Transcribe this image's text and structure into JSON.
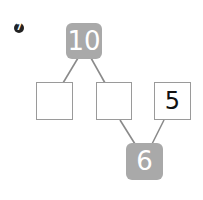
{
  "problem_number": "7",
  "top_node": {
    "value": "10"
  },
  "middle_row": [
    {
      "value": ""
    },
    {
      "value": ""
    },
    {
      "value": "5"
    }
  ],
  "bottom_node": {
    "value": "6"
  },
  "colors": {
    "filled_node": "#a9a9a9",
    "line": "#8a8a8a",
    "box_border": "#9a9a9a"
  }
}
